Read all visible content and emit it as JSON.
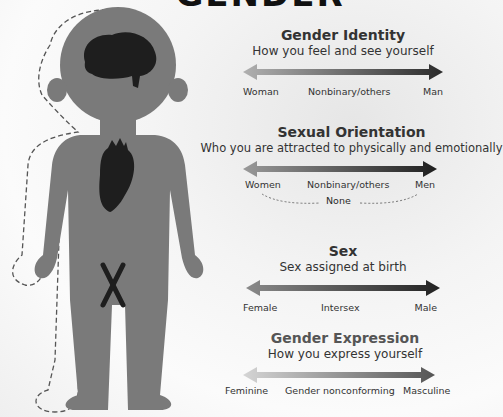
{
  "title": "GENDER",
  "colors": {
    "body": "#7a7a7a",
    "organ": "#1e1e1e",
    "arrow_light": "#b5b5b5",
    "arrow_dark": "#2b2b2b"
  },
  "figure": {
    "organs": [
      "brain-icon",
      "heart-icon",
      "chromosome-icon"
    ],
    "outline": "dashed"
  },
  "sections": [
    {
      "title": "Gender Identity",
      "subtitle": "How you feel and see yourself",
      "labels": [
        "Woman",
        "Nonbinary/others",
        "Man"
      ]
    },
    {
      "title": "Sexual Orientation",
      "subtitle": "Who you are attracted to physically and emotionally",
      "labels": [
        "Women",
        "Nonbinary/others",
        "Men"
      ],
      "extra": "None"
    },
    {
      "title": "Sex",
      "subtitle": "Sex assigned at birth",
      "labels": [
        "Female",
        "Intersex",
        "Male"
      ]
    },
    {
      "title": "Gender Expression",
      "subtitle": "How you express yourself",
      "labels": [
        "Feminine",
        "Gender nonconforming",
        "Masculine"
      ]
    }
  ]
}
